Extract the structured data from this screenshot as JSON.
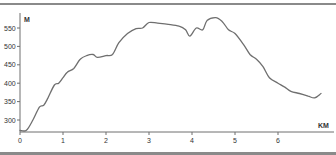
{
  "chart_data": {
    "type": "line",
    "title": "",
    "xlabel": "KM",
    "ylabel": "M",
    "xlim": [
      0,
      7.05
    ],
    "ylim": [
      268,
      585
    ],
    "grid": false,
    "legend": null,
    "x_ticks": [
      0,
      1,
      2,
      3,
      4,
      5,
      6
    ],
    "y_ticks": [
      300,
      350,
      400,
      450,
      500,
      550
    ],
    "series": [
      {
        "name": "Elevation profile",
        "color": "#6f6f6f",
        "x": [
          0,
          0.15,
          0.3,
          0.45,
          0.55,
          0.65,
          0.8,
          0.9,
          1.0,
          1.1,
          1.25,
          1.4,
          1.55,
          1.7,
          1.8,
          2.0,
          2.15,
          2.3,
          2.5,
          2.7,
          2.85,
          3.0,
          3.2,
          3.45,
          3.7,
          3.85,
          3.95,
          4.1,
          4.25,
          4.35,
          4.55,
          4.7,
          4.85,
          5.0,
          5.2,
          5.35,
          5.5,
          5.65,
          5.8,
          6.0,
          6.15,
          6.3,
          6.5,
          6.7,
          6.85,
          7.0
        ],
        "y": [
          272,
          272,
          300,
          335,
          340,
          360,
          395,
          400,
          415,
          430,
          440,
          465,
          475,
          478,
          470,
          475,
          478,
          510,
          535,
          548,
          550,
          565,
          563,
          560,
          555,
          545,
          528,
          550,
          545,
          570,
          578,
          568,
          545,
          535,
          505,
          478,
          465,
          445,
          415,
          400,
          390,
          378,
          372,
          365,
          360,
          372
        ]
      }
    ]
  },
  "labels": {
    "y_unit": "M",
    "x_unit": "KM"
  }
}
